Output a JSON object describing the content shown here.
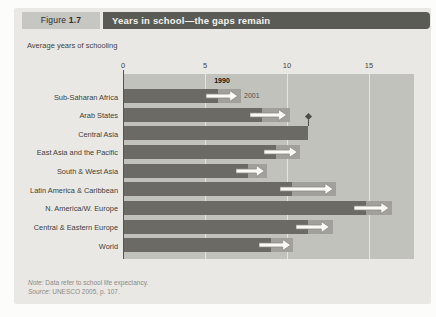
{
  "figure": {
    "label_prefix": "Figure",
    "label_number": "1.7",
    "title": "Years in school—the gaps remain"
  },
  "subtitle": "Average years of schooling",
  "series_labels": {
    "start": "1990",
    "end": "2001"
  },
  "chart_data": {
    "type": "bar",
    "orientation": "horizontal",
    "title": "Years in school—the gaps remain",
    "xlabel": "Average years of schooling",
    "xlim": [
      0,
      17.8
    ],
    "ticks": [
      0,
      5,
      10,
      15
    ],
    "grid": "vertical-light-on-gray",
    "categories": [
      "Sub-Saharan Africa",
      "Arab States",
      "Central Asia",
      "East Asia and the Pacific",
      "South & West Asia",
      "Latin America & Caribbean",
      "N. America/W. Europe",
      "Central & Eastern Europe",
      "World"
    ],
    "series": [
      {
        "name": "1990",
        "values": [
          5.8,
          8.5,
          11.3,
          9.3,
          7.6,
          10.3,
          14.8,
          11.3,
          9.0
        ]
      },
      {
        "name": "2001",
        "values": [
          7.0,
          10.0,
          null,
          10.6,
          8.6,
          12.8,
          16.2,
          12.6,
          10.2
        ]
      }
    ],
    "annotations": [
      {
        "category": "Central Asia",
        "marker": "◆",
        "position": "above-bar-end"
      }
    ],
    "legend": "inline: '1990' bold above first bar end, '2001' beside first arrow"
  },
  "notes": {
    "note_label": "Note:",
    "note_text": "Data refer to school life expectancy.",
    "source_label": "Source:",
    "source_text": "UNESCO 2005, p. 107."
  },
  "colors": {
    "card_bg": "#e9e8e4",
    "figure_box_bg": "#c6c6c3",
    "title_bar_bg": "#5a5b55",
    "title_text": "#f4f3f0",
    "plot_bg": "#c2c2bc",
    "gridline": "#e4e3dd",
    "bar_1990": "#6b6a65",
    "extension_2001": "#a1a09a",
    "arrow_fill": "#fbfaf7",
    "arrow_stroke": "#8e8d87",
    "text": "#45443f"
  }
}
